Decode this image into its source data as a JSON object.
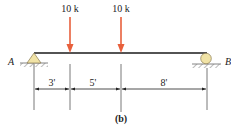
{
  "diagram": {
    "caption": "(b)",
    "beam": {
      "x_start": 34,
      "x_end": 207,
      "y": 53,
      "color": "#1a1a1a"
    },
    "supports": {
      "left": {
        "label": "A",
        "type": "pin",
        "fill": "#f1e3a6"
      },
      "right": {
        "label": "B",
        "type": "roller",
        "fill": "#f1e3a6"
      }
    },
    "loads": [
      {
        "label": "10 k",
        "position_ft": 3,
        "color": "#e8603c"
      },
      {
        "label": "10 k",
        "position_ft": 8,
        "color": "#e8603c"
      }
    ],
    "dimensions": [
      {
        "label": "3'",
        "length_ft": 3
      },
      {
        "label": "5'",
        "length_ft": 5
      },
      {
        "label": "8'",
        "length_ft": 8
      }
    ],
    "total_span_ft": 16
  }
}
